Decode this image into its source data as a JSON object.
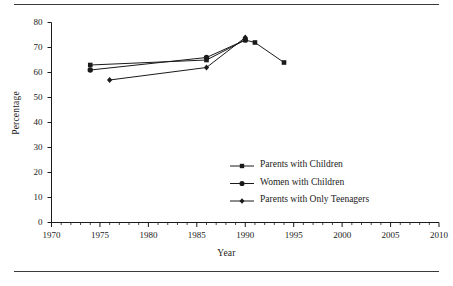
{
  "chart_data": {
    "type": "line",
    "title": "",
    "xlabel": "Year",
    "ylabel": "Percentage",
    "xlim": [
      1970,
      2010
    ],
    "ylim": [
      0,
      80
    ],
    "xticks": [
      1970,
      1975,
      1980,
      1985,
      1990,
      1995,
      2000,
      2005,
      2010
    ],
    "yticks": [
      0,
      10,
      20,
      30,
      40,
      50,
      60,
      70,
      80
    ],
    "minor_xtick_step": 1,
    "grid": false,
    "legend_position": "center-right",
    "series": [
      {
        "name": "Parents with Children",
        "marker": "square",
        "color": "#1a1a1a",
        "points": [
          {
            "x": 1974,
            "y": 63
          },
          {
            "x": 1986,
            "y": 65
          },
          {
            "x": 1990,
            "y": 73
          },
          {
            "x": 1991,
            "y": 72
          },
          {
            "x": 1994,
            "y": 64
          }
        ]
      },
      {
        "name": "Women with Children",
        "marker": "circle",
        "color": "#1a1a1a",
        "points": [
          {
            "x": 1974,
            "y": 61
          },
          {
            "x": 1986,
            "y": 66
          },
          {
            "x": 1990,
            "y": 73
          }
        ]
      },
      {
        "name": "Parents with Only Teenagers",
        "marker": "diamond",
        "color": "#1a1a1a",
        "points": [
          {
            "x": 1976,
            "y": 57
          },
          {
            "x": 1986,
            "y": 62
          },
          {
            "x": 1990,
            "y": 74
          }
        ]
      }
    ]
  },
  "axes": {
    "ylabel": "Percentage",
    "xlabel": "Year",
    "ytick_labels": [
      "0",
      "10",
      "20",
      "30",
      "40",
      "50",
      "60",
      "70",
      "80"
    ],
    "xtick_labels": [
      "1970",
      "1975",
      "1980",
      "1985",
      "1990",
      "1995",
      "2000",
      "2005",
      "2010"
    ]
  },
  "legend": {
    "items": [
      {
        "label": "Parents with Children",
        "marker": "square"
      },
      {
        "label": "Women with Children",
        "marker": "circle"
      },
      {
        "label": "Parents with Only Teenagers",
        "marker": "diamond"
      }
    ]
  },
  "colors": {
    "ink": "#1a1a1a",
    "rule": "#3a3a3a",
    "background": "#ffffff"
  }
}
